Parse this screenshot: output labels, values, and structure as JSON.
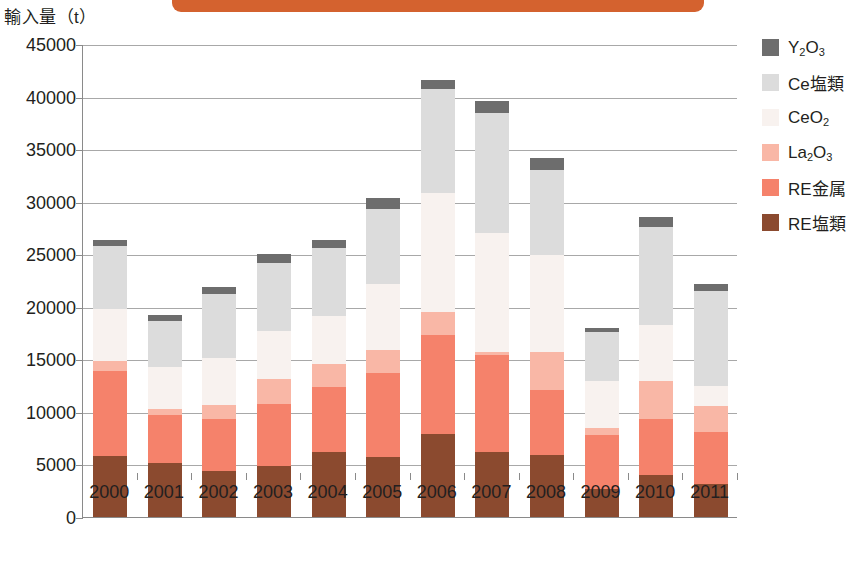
{
  "banner": {
    "label": ""
  },
  "axis": {
    "unit_label": "輸入量（t）",
    "y_ticks": [
      "45000",
      "40000",
      "35000",
      "30000",
      "25000",
      "20000",
      "15000",
      "10000",
      "5000",
      "0"
    ],
    "y_min": 0,
    "y_max": 45000
  },
  "legend": {
    "items": [
      {
        "label": "Y2O3",
        "html": "Y<sub>2</sub>O<sub>3</sub>",
        "color": "#6d6d6d"
      },
      {
        "label": "Ce塩類",
        "html": "Ce塩類",
        "color": "#dcdcdc"
      },
      {
        "label": "CeO2",
        "html": "CeO<sub>2</sub>",
        "color": "#f8f2ef"
      },
      {
        "label": "La2O3",
        "html": "La<sub>2</sub>O<sub>3</sub>",
        "color": "#f9b7a6"
      },
      {
        "label": "RE金属",
        "html": "RE金属",
        "color": "#f5826b"
      },
      {
        "label": "RE塩類",
        "html": "RE塩類",
        "color": "#8b4a2f"
      }
    ]
  },
  "chart_data": {
    "type": "bar",
    "subtype": "stacked-bar",
    "title": "",
    "xlabel": "",
    "ylabel": "輸入量（t）",
    "ylim": [
      0,
      45000
    ],
    "ytick_step": 5000,
    "grid": true,
    "legend_position": "right",
    "categories": [
      "2000",
      "2001",
      "2002",
      "2003",
      "2004",
      "2005",
      "2006",
      "2007",
      "2008",
      "2009",
      "2010",
      "2011"
    ],
    "series": [
      {
        "name": "RE塩類",
        "color": "#8b4a2f",
        "values": [
          5800,
          5100,
          4400,
          4900,
          6200,
          5700,
          7900,
          6200,
          5900,
          2700,
          4000,
          3100
        ]
      },
      {
        "name": "RE金属",
        "color": "#f5826b",
        "values": [
          8100,
          4600,
          4900,
          5900,
          6200,
          8000,
          9400,
          9200,
          6200,
          5100,
          5300,
          5000
        ]
      },
      {
        "name": "La2O3",
        "color": "#f9b7a6",
        "values": [
          900,
          600,
          1400,
          2300,
          2200,
          2200,
          2200,
          300,
          3600,
          700,
          3600,
          2500
        ]
      },
      {
        "name": "CeO2",
        "color": "#f8f2ef",
        "values": [
          5000,
          4000,
          4400,
          4600,
          4500,
          6300,
          11300,
          11300,
          9200,
          4400,
          5400,
          1900
        ]
      },
      {
        "name": "Ce塩類",
        "color": "#dcdcdc",
        "values": [
          6000,
          4400,
          6100,
          6500,
          6500,
          7100,
          9900,
          11400,
          8100,
          4700,
          9300,
          9000
        ]
      },
      {
        "name": "Y2O3",
        "color": "#6d6d6d",
        "values": [
          600,
          500,
          700,
          800,
          800,
          1100,
          900,
          1200,
          1200,
          400,
          900,
          700
        ]
      }
    ],
    "totals": [
      26400,
      19200,
      21900,
      25000,
      26400,
      30400,
      41600,
      39600,
      34200,
      18000,
      28500,
      22200
    ]
  }
}
